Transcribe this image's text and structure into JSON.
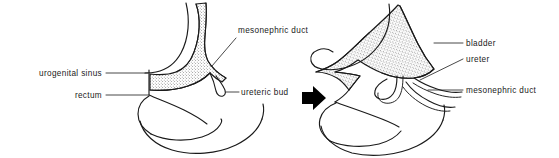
{
  "figure": {
    "background_color": "#ffffff",
    "ink_color": "#1a1a1a",
    "stipple_color": "#1a1a1a",
    "width": 559,
    "height": 158
  },
  "transition": {
    "arrow_icon": "right-arrow-icon",
    "direction": "right"
  },
  "panels": [
    {
      "id": "early-stage",
      "position": "left",
      "labels": [
        {
          "id": "urogenital-sinus",
          "text": "urogenital  sinus",
          "align": "right",
          "x": 68,
          "y": 76
        },
        {
          "id": "rectum",
          "text": "rectum",
          "align": "right",
          "x": 68,
          "y": 98
        },
        {
          "id": "mesonephric-duct",
          "text": "mesonephric duct",
          "align": "left",
          "x": 238,
          "y": 33
        },
        {
          "id": "ureteric-bud",
          "text": "ureteric  bud",
          "align": "left",
          "x": 241,
          "y": 95
        }
      ]
    },
    {
      "id": "later-stage",
      "position": "right",
      "labels": [
        {
          "id": "bladder",
          "text": "bladder",
          "align": "left",
          "x": 466,
          "y": 46
        },
        {
          "id": "ureter",
          "text": "ureter",
          "align": "left",
          "x": 466,
          "y": 62
        },
        {
          "id": "mesonephric-duct",
          "text": "mesonephric  duct",
          "align": "left",
          "x": 466,
          "y": 93
        }
      ]
    }
  ]
}
